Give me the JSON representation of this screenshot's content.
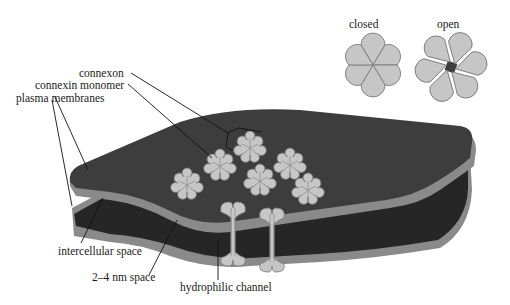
{
  "diagram": {
    "labels": {
      "connexon": "connexon",
      "connexin_monomer": "connexin monomer",
      "plasma_membranes": "plasma membranes",
      "intercellular_space": "intercellular space",
      "nm_space": "2–4 nm space",
      "hydrophilic_channel": "hydrophilic channel"
    },
    "inset": {
      "closed_label": "closed",
      "open_label": "open"
    },
    "colors": {
      "membrane_top": "#3d3d3d",
      "membrane_edge": "#8a8a8a",
      "intercellular_dark": "#262626",
      "connexon_fill": "#c4c4c4",
      "connexon_stroke": "#7a7a7a",
      "leader_line": "#111111"
    }
  }
}
